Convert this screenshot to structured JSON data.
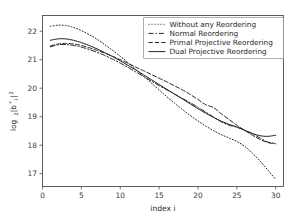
{
  "chart_data": {
    "type": "line",
    "title": "",
    "xlabel": "index i",
    "ylabel": "log2|b*i|^2",
    "ylabel_parts": {
      "base": "log",
      "base_sub": "2",
      "body": "|b",
      "body_sub": "i",
      "body_sup": "*",
      "tail": "|",
      "tail_sup": "2"
    },
    "xlim": [
      0,
      31
    ],
    "ylim": [
      16.55,
      22.55
    ],
    "xticks": [
      0,
      5,
      10,
      15,
      20,
      25,
      30
    ],
    "xtick_labels": [
      "0",
      "5",
      "10",
      "15",
      "20",
      "25",
      "30"
    ],
    "yticks": [
      17,
      18,
      19,
      20,
      21,
      22
    ],
    "ytick_labels": [
      "17",
      "18",
      "19",
      "20",
      "21",
      "22"
    ],
    "grid": false,
    "legend_position": "upper right",
    "x": [
      1,
      2,
      3,
      4,
      5,
      6,
      7,
      8,
      9,
      10,
      11,
      12,
      13,
      14,
      15,
      16,
      17,
      18,
      19,
      20,
      21,
      22,
      23,
      24,
      25,
      26,
      27,
      28,
      29,
      30
    ],
    "series": [
      {
        "name": "Without any Reordering",
        "style": "dotted",
        "dash": "1,2",
        "color": "#262626",
        "values": [
          22.17,
          22.21,
          22.2,
          22.13,
          22.02,
          21.88,
          21.72,
          21.53,
          21.33,
          21.12,
          20.89,
          20.66,
          20.42,
          20.18,
          19.94,
          19.7,
          19.47,
          19.25,
          19.04,
          18.85,
          18.67,
          18.51,
          18.37,
          18.25,
          18.13,
          17.96,
          17.72,
          17.44,
          17.12,
          16.8
        ]
      },
      {
        "name": "Normal Reordering",
        "style": "dashdot",
        "dash": "5,2,1.4,2",
        "color": "#262626",
        "values": [
          21.45,
          21.52,
          21.53,
          21.5,
          21.44,
          21.36,
          21.26,
          21.15,
          21.02,
          20.88,
          20.73,
          20.57,
          20.41,
          20.25,
          20.09,
          19.94,
          19.79,
          19.64,
          19.49,
          19.33,
          19.16,
          18.99,
          18.82,
          18.7,
          18.63,
          18.53,
          18.4,
          18.25,
          18.11,
          18.06
        ]
      },
      {
        "name": "Primal Projective Reordering",
        "style": "dashed",
        "dash": "4.2,2.2",
        "color": "#262626",
        "values": [
          21.48,
          21.55,
          21.57,
          21.55,
          21.5,
          21.42,
          21.33,
          21.23,
          21.12,
          21.0,
          20.87,
          20.74,
          20.61,
          20.48,
          20.35,
          20.22,
          20.08,
          19.94,
          19.78,
          19.6,
          19.42,
          19.32,
          19.1,
          18.9,
          18.7,
          18.52,
          18.35,
          18.2,
          18.09,
          18.05
        ]
      },
      {
        "name": "Dual Projective Reordering",
        "style": "solid",
        "dash": "",
        "color": "#262626",
        "values": [
          21.68,
          21.73,
          21.73,
          21.68,
          21.6,
          21.5,
          21.38,
          21.25,
          21.11,
          20.96,
          20.8,
          20.64,
          20.47,
          20.3,
          20.13,
          19.96,
          19.79,
          19.62,
          19.45,
          19.28,
          19.12,
          18.97,
          18.84,
          18.73,
          18.64,
          18.52,
          18.41,
          18.33,
          18.31,
          18.35
        ]
      }
    ],
    "legend_entries": [
      "Without any Reordering",
      "Normal Reordering",
      "Primal Projective Reordering",
      "Dual Projective Reordering"
    ]
  }
}
